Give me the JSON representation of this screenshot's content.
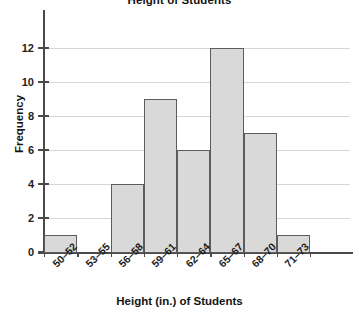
{
  "chart_data": {
    "type": "bar",
    "title": "Height of Students",
    "xlabel": "Height (in.) of Students",
    "ylabel": "Frequency",
    "categories": [
      "50–52",
      "53–55",
      "56–58",
      "59–61",
      "62–64",
      "65–67",
      "68–70",
      "71–73"
    ],
    "values": [
      1,
      0,
      4,
      9,
      6,
      12,
      7,
      1
    ],
    "ylim": [
      0,
      12
    ],
    "ytick_labels": [
      "0",
      "2",
      "4",
      "6",
      "8",
      "10",
      "12"
    ],
    "ytick_values": [
      0,
      2,
      4,
      6,
      8,
      10,
      12
    ],
    "grid": "horizontal",
    "legend": "none",
    "bar_fill_color": "#d9d9d9",
    "bar_border_color": "#5c5c5c",
    "gridline_color": "#d6d6d6",
    "axis_color": "#4a4a4a",
    "background_color": "#ffffff"
  }
}
